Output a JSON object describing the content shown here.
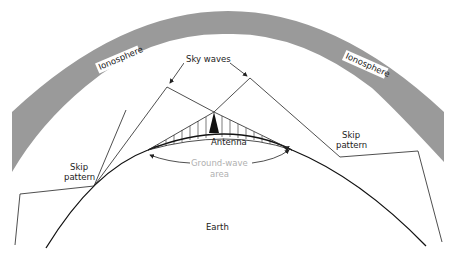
{
  "diagram": {
    "labels": {
      "ionosphere_left": "Ionosphere",
      "ionosphere_right": "Ionosphere",
      "sky_waves": "Sky waves",
      "antenna": "Antenna",
      "ground_wave_line1": "Ground-wave",
      "ground_wave_line2": "area",
      "skip_left_line1": "Skip",
      "skip_left_line2": "pattern",
      "skip_right_line1": "Skip",
      "skip_right_line2": "pattern",
      "earth": "Earth"
    },
    "colors": {
      "ionosphere": "#9a9a9a",
      "lines": "#222222",
      "ground_wave_label": "#b0b0b0",
      "background": "#ffffff"
    }
  }
}
